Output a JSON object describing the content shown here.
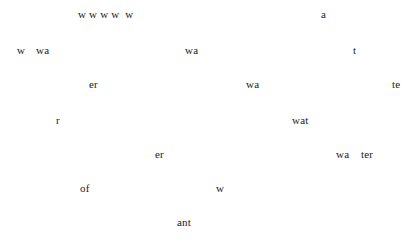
{
  "canvas": {
    "width": 415,
    "height": 248,
    "background_color": "#ffffff",
    "text_color": "#1b1b1b",
    "font_style": "serif",
    "description": "Sparse scattered text fragments spelling pieces of the words water / wa / ter / of / want on a blank white page"
  },
  "fragments": [
    {
      "text": "w w w w  w",
      "x": 78,
      "y": 9,
      "size": 11
    },
    {
      "text": "a",
      "x": 321,
      "y": 9,
      "size": 11
    },
    {
      "text": "w",
      "x": 17,
      "y": 45,
      "size": 11
    },
    {
      "text": "wa",
      "x": 36,
      "y": 45,
      "size": 11
    },
    {
      "text": "wa",
      "x": 185,
      "y": 45,
      "size": 11
    },
    {
      "text": "t",
      "x": 353,
      "y": 45,
      "size": 11
    },
    {
      "text": "er",
      "x": 89,
      "y": 79,
      "size": 11
    },
    {
      "text": "wa",
      "x": 246,
      "y": 79,
      "size": 11
    },
    {
      "text": "te",
      "x": 392,
      "y": 79,
      "size": 11
    },
    {
      "text": "r",
      "x": 56,
      "y": 115,
      "size": 11
    },
    {
      "text": "wat",
      "x": 292,
      "y": 115,
      "size": 11
    },
    {
      "text": "er",
      "x": 155,
      "y": 149,
      "size": 11
    },
    {
      "text": "wa",
      "x": 336,
      "y": 149,
      "size": 11
    },
    {
      "text": "ter",
      "x": 361,
      "y": 149,
      "size": 11
    },
    {
      "text": "of",
      "x": 80,
      "y": 183,
      "size": 11
    },
    {
      "text": "w",
      "x": 216,
      "y": 183,
      "size": 11
    },
    {
      "text": "ant",
      "x": 177,
      "y": 217,
      "size": 11
    }
  ]
}
